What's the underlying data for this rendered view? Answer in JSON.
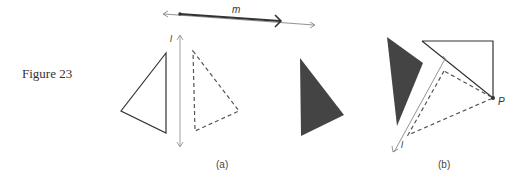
{
  "figure": {
    "caption": "Figure 23",
    "panels": [
      {
        "label": "(a)",
        "line_labels": [
          "m",
          "l"
        ]
      },
      {
        "label": "(b)",
        "line_labels": [
          "l"
        ],
        "point_labels": [
          "P"
        ]
      }
    ]
  },
  "colors": {
    "stroke": "#333333",
    "fill_dark": "#444444",
    "axis": "#888888"
  }
}
